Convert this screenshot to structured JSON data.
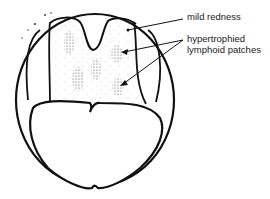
{
  "diagram": {
    "labels": {
      "mild_redness": "mild redness",
      "patches_line1": "hypertrophied",
      "patches_line2": "lymphoid patches"
    },
    "colors": {
      "stroke": "#111111",
      "stipple": "#555555",
      "background": "#ffffff"
    }
  }
}
